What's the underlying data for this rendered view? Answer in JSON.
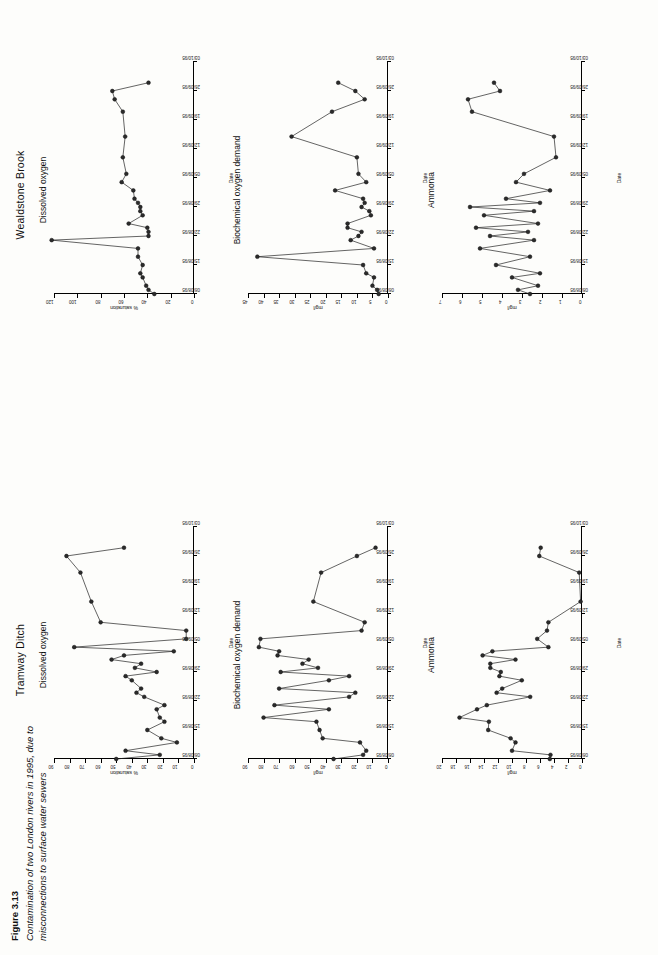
{
  "caption": {
    "figure_number": "Figure 3.13",
    "text": "Contamination of two London rivers in 1995, due to misconnections to surface water sewers"
  },
  "rivers": [
    {
      "name": "Tramway Ditch"
    },
    {
      "name": "Wealdstone Brook"
    }
  ],
  "axis_label_x": "Date",
  "dates": [
    "08/08/95",
    "15/08/95",
    "22/08/95",
    "29/08/95",
    "05/09/95",
    "12/09/95",
    "19/09/95",
    "26/09/95",
    "03/10/95"
  ],
  "chart_data": [
    {
      "id": "tramway-dissolved-oxygen",
      "river": "Tramway Ditch",
      "type": "line",
      "title": "Dissolved oxygen",
      "xlabel": "Date",
      "ylabel": "% saturation",
      "ylim": [
        0,
        90
      ],
      "yticks": [
        0,
        10,
        20,
        30,
        40,
        50,
        60,
        70,
        80,
        90
      ],
      "xlim_dates": [
        "08/08/95",
        "03/10/95"
      ],
      "xticks": [
        "08/08/95",
        "15/08/95",
        "22/08/95",
        "29/08/95",
        "05/09/95",
        "12/09/95",
        "19/09/95",
        "26/09/95",
        "03/10/95"
      ],
      "grid": false,
      "x": [
        0,
        1,
        2,
        4,
        5,
        7,
        9,
        10,
        12,
        13,
        15,
        16,
        17,
        19,
        20,
        21,
        22,
        23,
        24,
        25,
        26,
        27,
        29,
        31,
        33,
        38,
        45,
        49,
        51
      ],
      "values": [
        50,
        22,
        44,
        11,
        21,
        30,
        19,
        22,
        24,
        19,
        32,
        37,
        34,
        40,
        44,
        24,
        38,
        34,
        53,
        45,
        13,
        77,
        5,
        5,
        60,
        66,
        73,
        82,
        45
      ]
    },
    {
      "id": "tramway-biochemical-oxygen-demand",
      "river": "Tramway Ditch",
      "type": "line",
      "title": "Biochemical oxygen demand",
      "xlabel": "Date",
      "ylabel": "mg/l",
      "ylim": [
        0,
        90
      ],
      "yticks": [
        0,
        10,
        20,
        30,
        40,
        50,
        60,
        70,
        80,
        90
      ],
      "xlim_dates": [
        "08/08/95",
        "03/10/95"
      ],
      "xticks": [
        "08/08/95",
        "15/08/95",
        "22/08/95",
        "29/08/95",
        "05/09/95",
        "12/09/95",
        "19/09/95",
        "26/09/95",
        "03/10/95"
      ],
      "grid": false,
      "x": [
        0,
        1,
        2,
        4,
        5,
        7,
        9,
        10,
        12,
        13,
        15,
        16,
        17,
        19,
        20,
        21,
        22,
        23,
        24,
        25,
        26,
        27,
        29,
        31,
        33,
        38,
        45,
        49,
        51
      ],
      "values": [
        35,
        16,
        14,
        18,
        42,
        44,
        46,
        80,
        38,
        73,
        25,
        21,
        70,
        38,
        25,
        69,
        45,
        55,
        51,
        71,
        70,
        83,
        82,
        17,
        15,
        48,
        43,
        20,
        8
      ]
    },
    {
      "id": "tramway-ammonia",
      "river": "Tramway Ditch",
      "type": "line",
      "title": "Ammonia",
      "xlabel": "Date",
      "ylabel": "mg/l",
      "ylim": [
        0,
        20
      ],
      "yticks": [
        0,
        2,
        4,
        6,
        8,
        10,
        12,
        14,
        16,
        18,
        20
      ],
      "xlim_dates": [
        "08/08/95",
        "03/10/95"
      ],
      "xticks": [
        "08/08/95",
        "15/08/95",
        "22/08/95",
        "29/08/95",
        "05/09/95",
        "12/09/95",
        "19/09/95",
        "26/09/95",
        "03/10/95"
      ],
      "grid": false,
      "x": [
        0,
        1,
        2,
        4,
        5,
        7,
        9,
        10,
        12,
        13,
        15,
        16,
        17,
        19,
        20,
        21,
        22,
        23,
        24,
        25,
        26,
        27,
        29,
        31,
        33,
        38,
        45,
        49,
        51
      ],
      "values": [
        4.6,
        4.5,
        10,
        9.5,
        10.2,
        13.4,
        13.3,
        17.5,
        15,
        13.6,
        7.4,
        12.2,
        11.4,
        8.6,
        11.8,
        11.6,
        13.1,
        13.1,
        9.5,
        14.2,
        12.8,
        4.8,
        6.4,
        5,
        4.8,
        0.2,
        0.4,
        6.1,
        5.9
      ]
    },
    {
      "id": "wealdstone-dissolved-oxygen",
      "river": "Wealdstone Brook",
      "type": "line",
      "title": "Dissolved oxygen",
      "xlabel": "Date",
      "ylabel": "% saturation",
      "ylim": [
        0,
        120
      ],
      "yticks": [
        0,
        20,
        40,
        60,
        80,
        100,
        120
      ],
      "xlim_dates": [
        "08/08/95",
        "03/10/95"
      ],
      "xticks": [
        "08/08/95",
        "15/08/95",
        "22/08/95",
        "29/08/95",
        "05/09/95",
        "12/09/95",
        "19/09/95",
        "26/09/95",
        "03/10/95"
      ],
      "grid": false,
      "x": [
        0,
        1,
        2,
        4,
        5,
        7,
        9,
        11,
        13,
        14,
        15,
        16,
        17,
        19,
        20,
        21,
        22,
        23,
        25,
        27,
        29,
        33,
        38,
        44,
        47,
        49,
        51
      ],
      "values": [
        34,
        39,
        41,
        44,
        46,
        44,
        48,
        48,
        122,
        39,
        39,
        40,
        56,
        44,
        46,
        46,
        48,
        51,
        52,
        62,
        58,
        61,
        59,
        61,
        68,
        70,
        39
      ]
    },
    {
      "id": "wealdstone-biochemical-oxygen-demand",
      "river": "Wealdstone Brook",
      "type": "line",
      "title": "Biochemical oxygen demand",
      "xlabel": "Date",
      "ylabel": "mg/l",
      "ylim": [
        0,
        45
      ],
      "yticks": [
        0,
        5,
        10,
        15,
        20,
        25,
        30,
        35,
        40,
        45
      ],
      "xlim_dates": [
        "08/08/95",
        "03/10/95"
      ],
      "xticks": [
        "08/08/95",
        "15/08/95",
        "22/08/95",
        "29/08/95",
        "05/09/95",
        "12/09/95",
        "19/09/95",
        "26/09/95",
        "03/10/95"
      ],
      "grid": false,
      "x": [
        0,
        1,
        2,
        4,
        5,
        7,
        9,
        11,
        13,
        14,
        15,
        16,
        17,
        19,
        20,
        21,
        22,
        23,
        25,
        27,
        29,
        33,
        38,
        44,
        47,
        49,
        51
      ],
      "values": [
        3,
        3.5,
        5,
        4.5,
        7,
        8,
        42,
        4.5,
        12,
        9.5,
        8.5,
        13,
        13,
        5.5,
        6,
        8.5,
        7.5,
        8,
        17,
        7,
        9.5,
        10,
        31,
        18,
        7.5,
        10.5,
        16
      ]
    },
    {
      "id": "wealdstone-ammonia",
      "river": "Wealdstone Brook",
      "type": "line",
      "title": "Ammonia",
      "xlabel": "Date",
      "ylabel": "mg/l",
      "ylim": [
        0,
        7
      ],
      "yticks": [
        0,
        1,
        2,
        3,
        4,
        5,
        6,
        7
      ],
      "xlim_dates": [
        "08/08/95",
        "03/10/95"
      ],
      "xticks": [
        "08/08/95",
        "15/08/95",
        "22/08/95",
        "29/08/95",
        "05/09/95",
        "12/09/95",
        "19/09/95",
        "26/09/95",
        "03/10/95"
      ],
      "grid": false,
      "x": [
        0,
        1,
        2,
        4,
        5,
        7,
        9,
        11,
        13,
        14,
        15,
        16,
        17,
        19,
        20,
        21,
        22,
        23,
        25,
        27,
        29,
        33,
        38,
        44,
        47,
        49,
        51
      ],
      "values": [
        2.6,
        3.2,
        2.2,
        3.5,
        2.1,
        4.3,
        2.6,
        5.1,
        2.4,
        4.6,
        2.7,
        5.3,
        2.2,
        4.9,
        2.4,
        5.6,
        2.1,
        3.8,
        1.6,
        3.3,
        2.9,
        1.3,
        1.4,
        5.5,
        5.7,
        4.1,
        4.4
      ]
    }
  ]
}
